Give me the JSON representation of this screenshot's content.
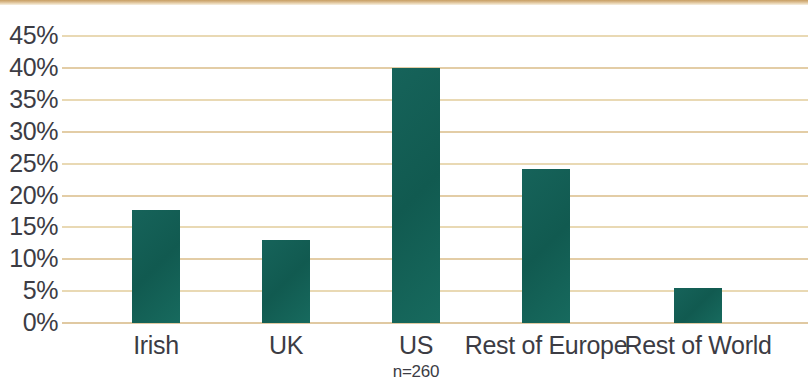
{
  "chart_data": {
    "type": "bar",
    "title": "",
    "subtitle": "",
    "xlabel": "",
    "ylabel": "",
    "categories": [
      "Irish",
      "UK",
      "US",
      "Rest of Europe",
      "Rest of World"
    ],
    "values": [
      17.8,
      13.0,
      40.0,
      24.2,
      5.5
    ],
    "value_labels": [
      "17.8%",
      "13%",
      "40%",
      "24.2%",
      "5.5%"
    ],
    "ylim": [
      0,
      47
    ],
    "ytick_values": [
      0,
      5,
      10,
      15,
      20,
      25,
      30,
      35,
      40,
      45
    ],
    "ytick_labels": [
      "0%",
      "5%",
      "10%",
      "15%",
      "20%",
      "25%",
      "30%",
      "35%",
      "40%",
      "45%"
    ],
    "annotation": "n=260",
    "annotation_category": "US",
    "grid": true,
    "grid_axis": "y",
    "legend": false,
    "legend_position": "none",
    "series": [
      {
        "name": "Share of respondents",
        "values": [
          17.8,
          13.0,
          40.0,
          24.2,
          5.5
        ]
      }
    ],
    "colors": {
      "bar": "#146055",
      "gridline": "#e3cda6",
      "baseline": "#e0c9a2",
      "text": "#3c3c44",
      "top_rule": "#c89f63",
      "background": "#ffffff"
    }
  },
  "axis": {
    "ticks": [
      {
        "label": "45%",
        "value": 45
      },
      {
        "label": "40%",
        "value": 40
      },
      {
        "label": "35%",
        "value": 35
      },
      {
        "label": "30%",
        "value": 30
      },
      {
        "label": "25%",
        "value": 25
      },
      {
        "label": "20%",
        "value": 20
      },
      {
        "label": "15%",
        "value": 15
      },
      {
        "label": "10%",
        "value": 10
      },
      {
        "label": "5%",
        "value": 5
      },
      {
        "label": "0%",
        "value": 0
      }
    ]
  },
  "bars": [
    {
      "label": "Irish",
      "value": 17.8
    },
    {
      "label": "UK",
      "value": 13.0
    },
    {
      "label": "US",
      "value": 40.0
    },
    {
      "label": "Rest of Europe",
      "value": 24.2
    },
    {
      "label": "Rest of World",
      "value": 5.5
    }
  ],
  "footnote": "n=260"
}
